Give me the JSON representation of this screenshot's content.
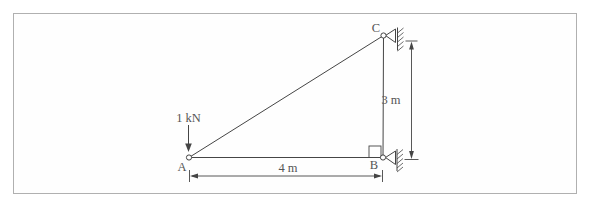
{
  "figure": {
    "type": "truss-support-diagram",
    "load_label": "1 kN",
    "joints": {
      "a": "A",
      "b": "B",
      "c": "C"
    },
    "dimensions": {
      "horizontal": "4 m",
      "vertical": "3 m"
    },
    "colors": {
      "line": "#454545",
      "text": "#555555",
      "frame_border": "#b0b0b0",
      "background": "#ffffff"
    }
  }
}
